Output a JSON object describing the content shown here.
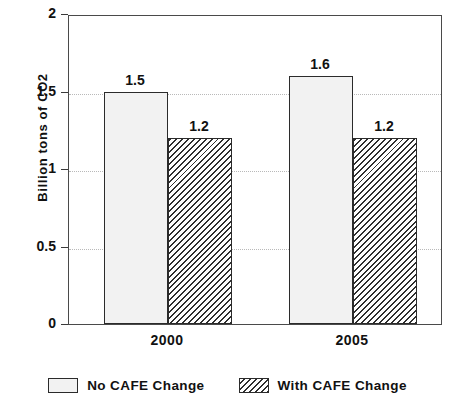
{
  "chart_data": {
    "type": "bar",
    "title": "",
    "subtitle": "",
    "xlabel": "",
    "ylabel": "Billion tons of CO2",
    "categories": [
      "2000",
      "2005"
    ],
    "series": [
      {
        "name": "No CAFE Change",
        "values": [
          1.5,
          1.6
        ],
        "labels": [
          "1.5",
          "1.6"
        ],
        "fill": "dotted-stipple",
        "color": "#f2f2f2"
      },
      {
        "name": "With CAFE Change",
        "values": [
          1.2,
          1.2
        ],
        "labels": [
          "1.2",
          "1.2"
        ],
        "fill": "diagonal-hatch",
        "color": "#2f2f2f"
      }
    ],
    "ylim": [
      0,
      2
    ],
    "yticks": [
      0,
      0.5,
      1,
      1.5,
      2
    ],
    "ytick_labels": [
      "0",
      "0.5",
      "1",
      "1.5",
      "2"
    ],
    "gridlines": [
      0.5,
      1,
      1.5
    ],
    "grid": true,
    "grid_style": "dotted",
    "legend_position": "bottom-center",
    "bar_border_color": "#2b2b2b",
    "axis_color": "#4a4a4a",
    "text_color": "#111111",
    "background": "#ffffff"
  },
  "axis": {
    "y_title": "Billion tons of CO2",
    "ticks": [
      {
        "label": "2",
        "value": 2
      },
      {
        "label": "1.5",
        "value": 1.5
      },
      {
        "label": "1",
        "value": 1
      },
      {
        "label": "0.5",
        "value": 0.5
      },
      {
        "label": "0",
        "value": 0
      }
    ],
    "x_labels": [
      "2000",
      "2005"
    ]
  },
  "bars": [
    {
      "group": "2000",
      "series": "No CAFE Change",
      "label": "1.5"
    },
    {
      "group": "2000",
      "series": "With CAFE Change",
      "label": "1.2"
    },
    {
      "group": "2005",
      "series": "No CAFE Change",
      "label": "1.6"
    },
    {
      "group": "2005",
      "series": "With CAFE Change",
      "label": "1.2"
    }
  ],
  "legend": {
    "entries": [
      {
        "label": "No CAFE Change"
      },
      {
        "label": "With CAFE Change"
      }
    ]
  }
}
